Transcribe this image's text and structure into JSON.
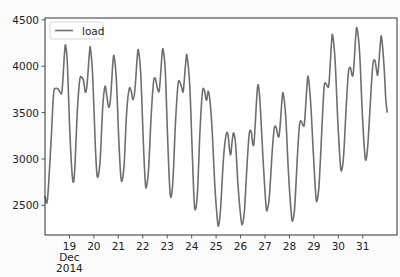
{
  "chart_data": {
    "type": "line",
    "title": "",
    "xlabel": "",
    "ylabel": "",
    "ylim": [
      2180,
      4520
    ],
    "xlim_days": [
      18.0,
      32.4
    ],
    "grid": false,
    "legend": {
      "position": "upper left",
      "entries": [
        "load"
      ]
    },
    "x_ticks": [
      "19",
      "20",
      "21",
      "22",
      "23",
      "24",
      "25",
      "26",
      "27",
      "28",
      "29",
      "30",
      "31"
    ],
    "x_tick_days": [
      19,
      20,
      21,
      22,
      23,
      24,
      25,
      26,
      27,
      28,
      29,
      30,
      31
    ],
    "x_secondary_label": [
      "Dec",
      "2014"
    ],
    "y_ticks": [
      2500,
      3000,
      3500,
      4000,
      4500
    ],
    "series": [
      {
        "name": "load",
        "color": "#6e6e6e",
        "points": [
          [
            18.0,
            2600
          ],
          [
            18.1,
            2560
          ],
          [
            18.25,
            3200
          ],
          [
            18.35,
            3700
          ],
          [
            18.45,
            3760
          ],
          [
            18.55,
            3750
          ],
          [
            18.62,
            3720
          ],
          [
            18.7,
            3740
          ],
          [
            18.8,
            4150
          ],
          [
            18.85,
            4220
          ],
          [
            18.92,
            4000
          ],
          [
            19.0,
            3400
          ],
          [
            19.08,
            2950
          ],
          [
            19.15,
            2750
          ],
          [
            19.22,
            2900
          ],
          [
            19.32,
            3500
          ],
          [
            19.42,
            3850
          ],
          [
            19.5,
            3880
          ],
          [
            19.58,
            3840
          ],
          [
            19.65,
            3720
          ],
          [
            19.72,
            3800
          ],
          [
            19.82,
            4150
          ],
          [
            19.86,
            4190
          ],
          [
            19.95,
            3900
          ],
          [
            20.05,
            3200
          ],
          [
            20.12,
            2850
          ],
          [
            20.18,
            2820
          ],
          [
            20.26,
            3000
          ],
          [
            20.36,
            3550
          ],
          [
            20.45,
            3780
          ],
          [
            20.52,
            3700
          ],
          [
            20.6,
            3560
          ],
          [
            20.68,
            3650
          ],
          [
            20.78,
            4050
          ],
          [
            20.83,
            4100
          ],
          [
            20.92,
            3850
          ],
          [
            21.02,
            3200
          ],
          [
            21.1,
            2820
          ],
          [
            21.16,
            2770
          ],
          [
            21.24,
            2950
          ],
          [
            21.34,
            3500
          ],
          [
            21.44,
            3750
          ],
          [
            21.52,
            3740
          ],
          [
            21.6,
            3640
          ],
          [
            21.68,
            3750
          ],
          [
            21.78,
            4120
          ],
          [
            21.83,
            4160
          ],
          [
            21.92,
            3900
          ],
          [
            22.02,
            3200
          ],
          [
            22.1,
            2760
          ],
          [
            22.15,
            2700
          ],
          [
            22.24,
            2900
          ],
          [
            22.34,
            3450
          ],
          [
            22.44,
            3830
          ],
          [
            22.52,
            3860
          ],
          [
            22.6,
            3760
          ],
          [
            22.68,
            3750
          ],
          [
            22.78,
            4100
          ],
          [
            22.83,
            4180
          ],
          [
            22.92,
            3950
          ],
          [
            23.02,
            3200
          ],
          [
            23.1,
            2700
          ],
          [
            23.16,
            2590
          ],
          [
            23.24,
            2800
          ],
          [
            23.34,
            3400
          ],
          [
            23.44,
            3800
          ],
          [
            23.52,
            3830
          ],
          [
            23.6,
            3760
          ],
          [
            23.66,
            3740
          ],
          [
            23.76,
            4050
          ],
          [
            23.81,
            4110
          ],
          [
            23.92,
            3800
          ],
          [
            24.02,
            3100
          ],
          [
            24.1,
            2550
          ],
          [
            24.16,
            2460
          ],
          [
            24.24,
            2650
          ],
          [
            24.34,
            3300
          ],
          [
            24.44,
            3720
          ],
          [
            24.52,
            3740
          ],
          [
            24.58,
            3650
          ],
          [
            24.62,
            3640
          ],
          [
            24.68,
            3730
          ],
          [
            24.76,
            3600
          ],
          [
            24.85,
            3250
          ],
          [
            24.95,
            2700
          ],
          [
            25.05,
            2350
          ],
          [
            25.1,
            2280
          ],
          [
            25.18,
            2450
          ],
          [
            25.3,
            3000
          ],
          [
            25.4,
            3250
          ],
          [
            25.48,
            3270
          ],
          [
            25.55,
            3100
          ],
          [
            25.6,
            3050
          ],
          [
            25.66,
            3200
          ],
          [
            25.72,
            3280
          ],
          [
            25.8,
            3150
          ],
          [
            25.9,
            2700
          ],
          [
            26.02,
            2350
          ],
          [
            26.08,
            2300
          ],
          [
            26.16,
            2450
          ],
          [
            26.28,
            3000
          ],
          [
            26.36,
            3280
          ],
          [
            26.44,
            3290
          ],
          [
            26.5,
            3160
          ],
          [
            26.56,
            3200
          ],
          [
            26.66,
            3650
          ],
          [
            26.72,
            3800
          ],
          [
            26.8,
            3600
          ],
          [
            26.92,
            3000
          ],
          [
            27.04,
            2500
          ],
          [
            27.1,
            2460
          ],
          [
            27.18,
            2600
          ],
          [
            27.3,
            3100
          ],
          [
            27.38,
            3330
          ],
          [
            27.46,
            3340
          ],
          [
            27.54,
            3240
          ],
          [
            27.6,
            3300
          ],
          [
            27.7,
            3650
          ],
          [
            27.75,
            3700
          ],
          [
            27.85,
            3450
          ],
          [
            27.96,
            2850
          ],
          [
            28.08,
            2400
          ],
          [
            28.14,
            2340
          ],
          [
            28.22,
            2500
          ],
          [
            28.34,
            3100
          ],
          [
            28.42,
            3380
          ],
          [
            28.5,
            3400
          ],
          [
            28.56,
            3360
          ],
          [
            28.62,
            3400
          ],
          [
            28.72,
            3800
          ],
          [
            28.77,
            3880
          ],
          [
            28.87,
            3600
          ],
          [
            28.98,
            3050
          ],
          [
            29.08,
            2600
          ],
          [
            29.14,
            2560
          ],
          [
            29.22,
            2750
          ],
          [
            29.34,
            3400
          ],
          [
            29.42,
            3780
          ],
          [
            29.5,
            3810
          ],
          [
            29.56,
            3780
          ],
          [
            29.62,
            3820
          ],
          [
            29.72,
            4250
          ],
          [
            29.77,
            4330
          ],
          [
            29.87,
            4050
          ],
          [
            29.98,
            3400
          ],
          [
            30.08,
            2950
          ],
          [
            30.14,
            2880
          ],
          [
            30.22,
            3050
          ],
          [
            30.34,
            3650
          ],
          [
            30.42,
            3950
          ],
          [
            30.5,
            3980
          ],
          [
            30.56,
            3900
          ],
          [
            30.62,
            3950
          ],
          [
            30.72,
            4350
          ],
          [
            30.77,
            4400
          ],
          [
            30.87,
            4150
          ],
          [
            30.98,
            3500
          ],
          [
            31.08,
            3060
          ],
          [
            31.14,
            3000
          ],
          [
            31.22,
            3200
          ],
          [
            31.34,
            3750
          ],
          [
            31.42,
            4030
          ],
          [
            31.5,
            4060
          ],
          [
            31.56,
            3960
          ],
          [
            31.62,
            3920
          ],
          [
            31.72,
            4250
          ],
          [
            31.77,
            4310
          ],
          [
            31.87,
            4000
          ],
          [
            31.94,
            3650
          ],
          [
            32.0,
            3500
          ]
        ]
      }
    ]
  }
}
